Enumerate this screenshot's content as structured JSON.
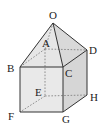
{
  "figure": {
    "type": "solid-geometry",
    "labels": {
      "O": "O",
      "A": "A",
      "B": "B",
      "C": "C",
      "D": "D",
      "E": "E",
      "F": "F",
      "G": "G",
      "H": "H"
    },
    "colors": {
      "edge": "#333333",
      "hidden_edge": "#777777",
      "face_front": "#e8e8e8",
      "face_side": "#d4d4d4",
      "face_pyramid": "#e4e4e4"
    }
  }
}
